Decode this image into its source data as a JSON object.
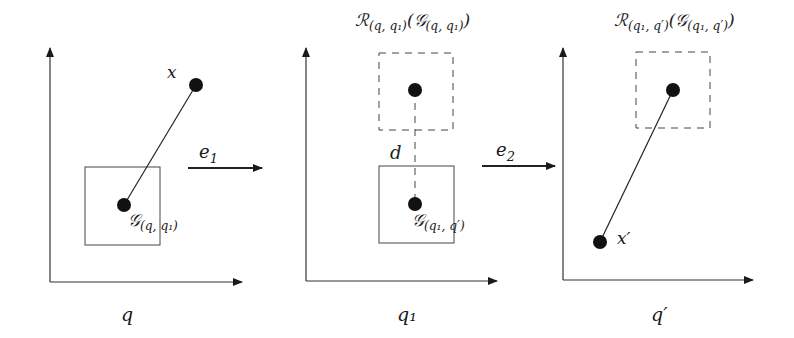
{
  "colors": {
    "ink": "#1a1a1a",
    "background": "#ffffff"
  },
  "panels": [
    {
      "id": "panel-q",
      "axis_label": "q",
      "point_label": "x",
      "box_label_main": "𝒢",
      "box_label_sub": "(q, q₁)"
    },
    {
      "id": "panel-q1",
      "axis_label": "q₁",
      "title_main": "ℛ",
      "title_sub": "(q, q₁)",
      "title_arg_main": "(𝒢",
      "title_arg_sub": "(q, q₁)",
      "title_close": ")",
      "distance_label": "d",
      "box_label_main": "𝒢",
      "box_label_sub": "(q₁, q′)"
    },
    {
      "id": "panel-q-prime",
      "axis_label": "q′",
      "point_label": "x′",
      "title_main": "ℛ",
      "title_sub": "(q₁, q′)",
      "title_arg_main": "(𝒢",
      "title_arg_sub": "(q₁, q′)",
      "title_close": ")"
    }
  ],
  "transitions": [
    {
      "label_main": "e",
      "label_sub": "1"
    },
    {
      "label_main": "e",
      "label_sub": "2"
    }
  ]
}
